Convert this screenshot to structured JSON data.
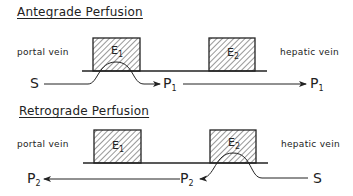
{
  "antegrade": {
    "title": "Antegrade Perfusion",
    "left_label": "portal vein",
    "right_label": "hepatic vein",
    "box1": {
      "letter": "E",
      "sub": "1"
    },
    "box2": {
      "letter": "E",
      "sub": "2"
    },
    "substrate": "S",
    "product_mid": {
      "letter": "P",
      "sub": "1"
    },
    "product_end": {
      "letter": "P",
      "sub": "1"
    }
  },
  "retrograde": {
    "title": "Retrograde Perfusion",
    "left_label": "portal vein",
    "right_label": "hepatic vein",
    "box1": {
      "letter": "E",
      "sub": "1"
    },
    "box2": {
      "letter": "E",
      "sub": "2"
    },
    "substrate": "S",
    "product_mid": {
      "letter": "P",
      "sub": "2"
    },
    "product_end": {
      "letter": "P",
      "sub": "2"
    }
  },
  "colors": {
    "ink": "#222222",
    "background": "#ffffff"
  }
}
